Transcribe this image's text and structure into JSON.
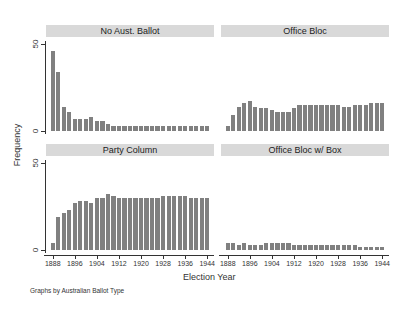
{
  "chart_data": {
    "type": "bar",
    "layout": "2x2 small multiples",
    "xlabel": "Election Year",
    "ylabel": "Frequency",
    "note": "Graphs by Australian Ballot Type",
    "x": [
      1888,
      1890,
      1892,
      1894,
      1896,
      1898,
      1900,
      1902,
      1904,
      1906,
      1908,
      1910,
      1912,
      1914,
      1916,
      1918,
      1920,
      1922,
      1924,
      1926,
      1928,
      1930,
      1932,
      1934,
      1936,
      1938,
      1940,
      1942,
      1944
    ],
    "xticks": [
      "1888",
      "1896",
      "1904",
      "1912",
      "1920",
      "1928",
      "1936",
      "1944"
    ],
    "yticks": [
      "0",
      "50"
    ],
    "ylim": [
      0,
      55
    ],
    "grid": false,
    "panels": [
      {
        "title": "No Aust. Ballot",
        "values": [
          46,
          34,
          14,
          11,
          7,
          7,
          7,
          8,
          6,
          6,
          4,
          3,
          3,
          3,
          3,
          3,
          3,
          3,
          3,
          3,
          3,
          3,
          3,
          3,
          3,
          3,
          3,
          3,
          3
        ]
      },
      {
        "title": "Office Bloc",
        "values": [
          3,
          9,
          14,
          16,
          17,
          14,
          13,
          13,
          12,
          11,
          11,
          11,
          13,
          15,
          15,
          15,
          15,
          15,
          15,
          15,
          15,
          14,
          14,
          15,
          15,
          15,
          16,
          16,
          16
        ]
      },
      {
        "title": "Party Column",
        "values": [
          4,
          19,
          21,
          23,
          27,
          28,
          28,
          27,
          30,
          30,
          32,
          31,
          30,
          30,
          30,
          30,
          30,
          30,
          30,
          30,
          31,
          31,
          31,
          31,
          31,
          30,
          30,
          30,
          30
        ]
      },
      {
        "title": "Office Bloc w/ Box",
        "values": [
          4,
          4,
          3,
          4,
          3,
          3,
          3,
          4,
          4,
          4,
          4,
          4,
          3,
          3,
          3,
          3,
          3,
          3,
          3,
          3,
          3,
          3,
          3,
          3,
          2,
          2,
          2,
          2,
          2
        ]
      }
    ]
  },
  "labels": {
    "xlabel": "Election Year",
    "ylabel": "Frequency",
    "note": "Graphs by Australian Ballot Type"
  }
}
